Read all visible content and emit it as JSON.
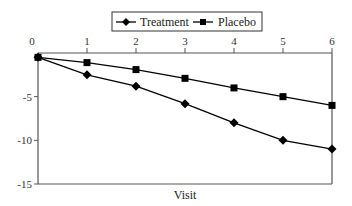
{
  "chart_data": {
    "type": "line",
    "title": "",
    "xlabel": "Visit",
    "ylabel": "",
    "x": [
      0,
      1,
      2,
      3,
      4,
      5,
      6
    ],
    "x_ticks": [
      "0",
      "1",
      "2",
      "3",
      "4",
      "5",
      "6"
    ],
    "y_ticks": [
      "0",
      "-5",
      "-10",
      "-15"
    ],
    "y_tick_values": [
      0,
      -5,
      -10,
      -15
    ],
    "xlim": [
      0,
      6
    ],
    "ylim": [
      -15,
      0
    ],
    "x_axis_position": "top",
    "grid": false,
    "legend": {
      "placement": "top-center",
      "boxed": true
    },
    "series": [
      {
        "name": "Treatment",
        "marker": "diamond",
        "color": "#000000",
        "values": [
          -0.5,
          -2.5,
          -3.8,
          -5.8,
          -8.0,
          -10.0,
          -11.0
        ]
      },
      {
        "name": "Placebo",
        "marker": "square",
        "color": "#000000",
        "values": [
          -0.5,
          -1.1,
          -1.9,
          -2.9,
          -4.0,
          -5.0,
          -6.0
        ]
      }
    ]
  }
}
